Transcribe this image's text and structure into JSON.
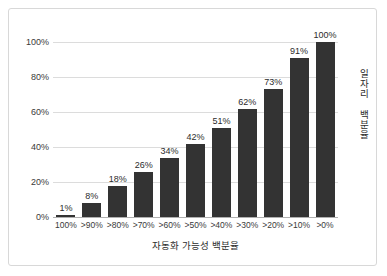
{
  "chart_data": {
    "type": "bar",
    "title": "",
    "categories": [
      "100%",
      ">90%",
      ">80%",
      ">70%",
      ">60%",
      ">50%",
      ">40%",
      ">30%",
      ">20%",
      ">10%",
      ">0%"
    ],
    "values": [
      1,
      8,
      18,
      26,
      34,
      42,
      51,
      62,
      73,
      91,
      100
    ],
    "data_labels": [
      "1%",
      "8%",
      "18%",
      "26%",
      "34%",
      "42%",
      "51%",
      "62%",
      "73%",
      "91%",
      "100%"
    ],
    "xlabel": "자동화 가능성 백분율",
    "ylabel": "일자리 백분율",
    "ylim": [
      0,
      100
    ],
    "ytick_labels": [
      "0%",
      "20%",
      "40%",
      "60%",
      "80%",
      "100%"
    ],
    "ytick_values": [
      0,
      20,
      40,
      60,
      80,
      100
    ],
    "grid": true,
    "legend": "none",
    "bar_color": "#333333",
    "gridline_color": "#dcdcdc",
    "axis_color": "#b0b0b0",
    "border_color": "#d8d8d8",
    "background": "#ffffff"
  }
}
